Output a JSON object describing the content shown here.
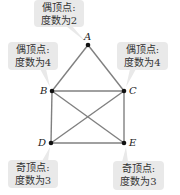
{
  "diagram": {
    "type": "graph",
    "vertices": [
      {
        "id": "A",
        "x": 88,
        "y": 45
      },
      {
        "id": "B",
        "x": 52,
        "y": 91
      },
      {
        "id": "C",
        "x": 124,
        "y": 91
      },
      {
        "id": "D",
        "x": 51,
        "y": 143
      },
      {
        "id": "E",
        "x": 124,
        "y": 143
      }
    ],
    "edges": [
      [
        "A",
        "B"
      ],
      [
        "A",
        "C"
      ],
      [
        "B",
        "C"
      ],
      [
        "B",
        "D"
      ],
      [
        "C",
        "E"
      ],
      [
        "D",
        "E"
      ],
      [
        "B",
        "E"
      ],
      [
        "C",
        "D"
      ]
    ],
    "callouts": [
      {
        "vertex": "A",
        "line1": "偶顶点:",
        "line2": "度数为2"
      },
      {
        "vertex": "B",
        "line1": "偶顶点:",
        "line2": "度数为4"
      },
      {
        "vertex": "C",
        "line1": "偶顶点:",
        "line2": "度数为4"
      },
      {
        "vertex": "D",
        "line1": "奇顶点:",
        "line2": "度数为3"
      },
      {
        "vertex": "E",
        "line1": "奇顶点:",
        "line2": "度数为3"
      }
    ],
    "colors": {
      "edge": "#808080",
      "vertex": "#111111",
      "callout_bg": "#e9e9e9"
    }
  }
}
